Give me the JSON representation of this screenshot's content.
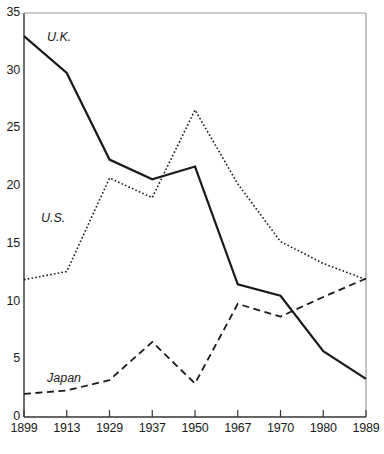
{
  "chart_data": {
    "type": "line",
    "title": "",
    "subtitle": "",
    "xlabel": "",
    "ylabel": "",
    "categories": [
      "1899",
      "1913",
      "1929",
      "1937",
      "1950",
      "1967",
      "1970",
      "1980",
      "1989"
    ],
    "x_tick_labels": [
      "1899",
      "1913",
      "1929",
      "1937",
      "1950",
      "1967",
      "1970",
      "1980",
      "1989"
    ],
    "y_tick_labels": [
      "0",
      "5",
      "10",
      "15",
      "20",
      "25",
      "30",
      "35"
    ],
    "y_ticks": [
      0,
      5,
      10,
      15,
      20,
      25,
      30,
      35
    ],
    "ylim": [
      0,
      35
    ],
    "grid": false,
    "legend_position": "inline-annotations",
    "series": [
      {
        "name": "U.K.",
        "style": "solid",
        "color": "#1a1a1a",
        "values": [
          33.0,
          29.8,
          22.3,
          20.6,
          21.7,
          11.5,
          10.5,
          5.7,
          3.3
        ]
      },
      {
        "name": "U.S.",
        "style": "dotted",
        "color": "#1a1a1a",
        "values": [
          11.9,
          12.6,
          20.7,
          19.0,
          26.6,
          20.2,
          15.2,
          13.3,
          11.9
        ]
      },
      {
        "name": "Japan",
        "style": "dashed",
        "color": "#1a1a1a",
        "values": [
          2.0,
          2.3,
          3.2,
          6.5,
          2.9,
          9.8,
          8.7,
          10.4,
          12.0
        ]
      }
    ],
    "annotations": [
      {
        "text": "U.K.",
        "x_px": 47,
        "y_px": 30
      },
      {
        "text": "U.S.",
        "x_px": 41,
        "y_px": 211
      },
      {
        "text": "Japan",
        "x_px": 47,
        "y_px": 371
      }
    ]
  },
  "axes": {
    "y_axis_name": "value-axis",
    "x_axis_name": "year-axis"
  }
}
